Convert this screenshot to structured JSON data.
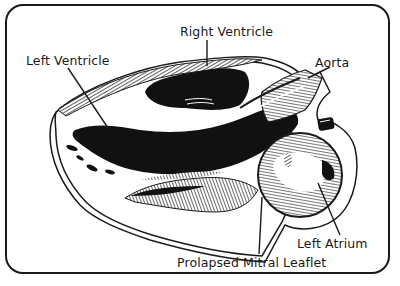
{
  "diagram": {
    "labels": {
      "right_ventricle": "Right Ventricle",
      "left_ventricle": "Left Ventricle",
      "aorta": "Aorta",
      "left_atrium": "Left Atrium",
      "prolapsed_mitral_leaflet": "Prolapsed Mitral Leaflet"
    },
    "colors": {
      "ink": "#1a1a1a",
      "background": "#ffffff"
    }
  }
}
